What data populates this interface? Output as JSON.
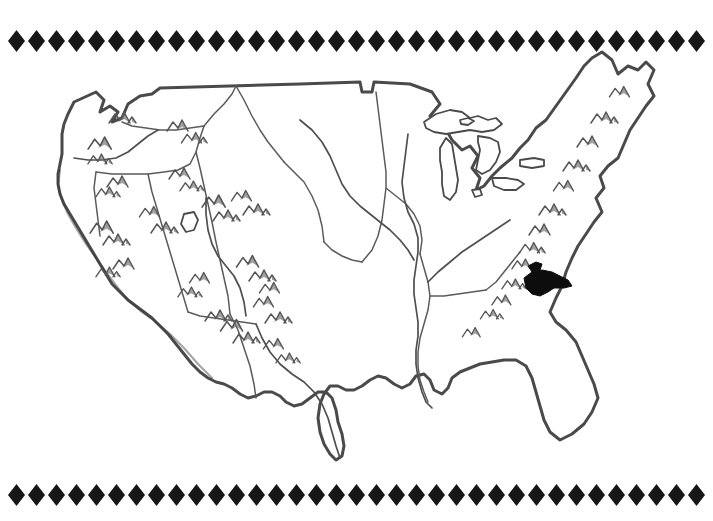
{
  "page": {
    "width": 713,
    "height": 521,
    "background_color": "#ffffff",
    "style": "black-and-white line art / clip-art"
  },
  "colors": {
    "ink": "#3a3a3a",
    "coast_ink": "#4a4a4a",
    "mountain_shade": "#6e6e6e",
    "highlight": "#0d0d0d",
    "border_diamond": "#161616",
    "paper": "#ffffff"
  },
  "decorative_border": {
    "motif": "diamond",
    "motif_icon": "diamond-icon",
    "count_per_band": 35,
    "diamond_width": 17,
    "diamond_height": 22,
    "pitch": 20,
    "start_x": 8,
    "bands": [
      {
        "name": "top",
        "y": 28
      },
      {
        "name": "bottom",
        "y": 482
      }
    ]
  },
  "map": {
    "subject": "Contiguous United States (lower 48)",
    "features": {
      "coastline": "Pacific, Gulf and Atlantic coasts outlined with heavy shaded stroke",
      "northern_border": "49th parallel with Lake of the Woods notch",
      "great_lakes": [
        "Superior",
        "Michigan",
        "Huron",
        "Erie",
        "Ontario"
      ],
      "rivers": [
        "Mississippi",
        "Missouri",
        "Ohio",
        "Rio Grande",
        "Columbia",
        "Colorado"
      ],
      "mountain_symbol_count": 38,
      "mountain_ranges": [
        "Cascades",
        "Sierra Nevada",
        "Rocky Mountains",
        "Appalachians"
      ]
    },
    "highlight": {
      "label": "filled-black-region",
      "shape": "solid black blot",
      "approx_center_x": 548,
      "approx_center_y": 281,
      "color": "#0d0d0d"
    }
  }
}
